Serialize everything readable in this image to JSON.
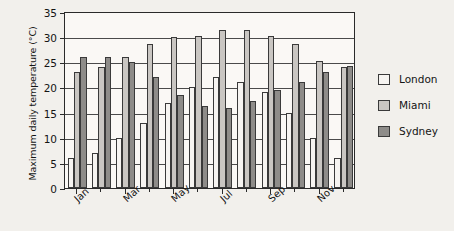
{
  "chart_data": {
    "type": "bar",
    "title": "",
    "xlabel": "",
    "ylabel": "Maximum daily temperature (°C)",
    "ylim": [
      0,
      35
    ],
    "ytick_values": [
      0,
      5,
      10,
      15,
      20,
      25,
      30,
      35
    ],
    "ytick_labels": [
      "0",
      "5",
      "10",
      "15",
      "20",
      "25",
      "30",
      "35"
    ],
    "grid": true,
    "legend_position": "right",
    "categories": [
      "Jan",
      "Feb",
      "Mar",
      "Apr",
      "May",
      "Jun",
      "Jul",
      "Aug",
      "Sep",
      "Oct",
      "Nov",
      "Dec"
    ],
    "xtick_labels": [
      "Jan",
      "Mar",
      "May",
      "Jul",
      "Sep",
      "Nov"
    ],
    "xtick_label_indices": [
      0,
      2,
      4,
      6,
      8,
      10
    ],
    "series": [
      {
        "name": "London",
        "color": "#f6f4f1",
        "values": [
          6,
          7,
          10,
          13,
          17,
          20,
          22,
          21,
          19,
          15,
          10,
          6
        ]
      },
      {
        "name": "Miami",
        "color": "#c9c6c2",
        "values": [
          23,
          24,
          26,
          28.7,
          30,
          30.3,
          31.5,
          31.5,
          30.3,
          28.7,
          25.3,
          24
        ]
      },
      {
        "name": "Sydney",
        "color": "#8e8c89",
        "values": [
          26,
          26,
          25,
          22,
          18.5,
          16.3,
          16,
          17.3,
          19.5,
          21,
          23,
          24.3
        ]
      }
    ]
  },
  "legend": {
    "items": [
      {
        "label": "London"
      },
      {
        "label": "Miami"
      },
      {
        "label": "Sydney"
      }
    ]
  }
}
